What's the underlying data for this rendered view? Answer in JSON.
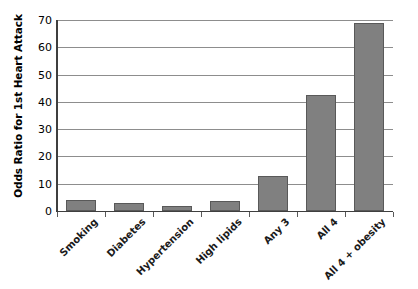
{
  "chart_data": {
    "type": "bar",
    "title": "",
    "xlabel": "",
    "ylabel": "Odds Ratio for 1st Heart Attack",
    "categories": [
      "Smoking",
      "Diabetes",
      "Hypertension",
      "High lipids",
      "Any 3",
      "All 4",
      "All 4 + obesity"
    ],
    "values": [
      4,
      3,
      2,
      3.5,
      13,
      42.5,
      69
    ],
    "ylim": [
      0,
      70
    ],
    "yticks": [
      0,
      10,
      20,
      30,
      40,
      50,
      60,
      70
    ],
    "ytick_labels": [
      "0",
      "10",
      "20",
      "30",
      "40",
      "50",
      "60",
      "70"
    ],
    "grid": true,
    "legend": false,
    "legend_position": "none",
    "series": [
      {
        "name": "Odds Ratio for 1st Heart Attack",
        "values": [
          4,
          3,
          2,
          3.5,
          13,
          42.5,
          69
        ]
      }
    ],
    "colors": {
      "bar_fill": "#808080",
      "bar_border": "#595959",
      "gridline": "#8d8d8d",
      "axis": "#3f3f3f",
      "background": "#ffffff",
      "text": "#000000"
    }
  }
}
